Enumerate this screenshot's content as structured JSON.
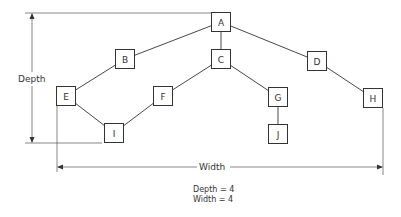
{
  "diagram": {
    "type": "tree",
    "nodes": [
      {
        "id": "A",
        "label": "A",
        "x": 221,
        "y": 22
      },
      {
        "id": "B",
        "label": "B",
        "x": 125,
        "y": 59
      },
      {
        "id": "C",
        "label": "C",
        "x": 221,
        "y": 59
      },
      {
        "id": "D",
        "label": "D",
        "x": 317,
        "y": 61
      },
      {
        "id": "E",
        "label": "E",
        "x": 66,
        "y": 96
      },
      {
        "id": "F",
        "label": "F",
        "x": 163,
        "y": 96
      },
      {
        "id": "G",
        "label": "G",
        "x": 278,
        "y": 97
      },
      {
        "id": "H",
        "label": "H",
        "x": 373,
        "y": 98
      },
      {
        "id": "I",
        "label": "I",
        "x": 114,
        "y": 133
      },
      {
        "id": "J",
        "label": "J",
        "x": 278,
        "y": 134
      }
    ],
    "edges": [
      [
        "A",
        "B"
      ],
      [
        "A",
        "C"
      ],
      [
        "A",
        "D"
      ],
      [
        "B",
        "E"
      ],
      [
        "C",
        "F"
      ],
      [
        "C",
        "G"
      ],
      [
        "D",
        "H"
      ],
      [
        "E",
        "I"
      ],
      [
        "F",
        "I"
      ],
      [
        "G",
        "J"
      ]
    ],
    "dimensions": {
      "depth_label": "Depth",
      "width_label": "Width"
    }
  },
  "caption": {
    "depth_line": "Depth = 4",
    "width_line": "Width = 4"
  }
}
